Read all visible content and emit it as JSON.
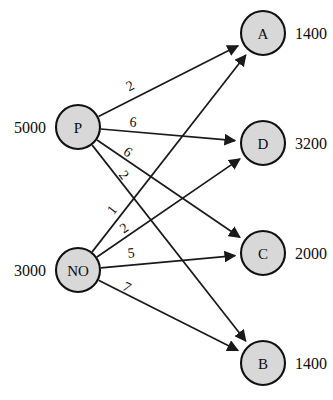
{
  "diagram": {
    "type": "bipartite-network",
    "colors": {
      "node_fill": "#d8d8d8",
      "node_stroke": "#111111",
      "edge": "#1a1a1a",
      "text": "#0d0d0d",
      "background": "#ffffff"
    },
    "sources": [
      {
        "id": "P",
        "label": "P",
        "value": "5000",
        "cx": 78,
        "cy": 127,
        "r": 22
      },
      {
        "id": "NO",
        "label": "NO",
        "value": "3000",
        "cx": 78,
        "cy": 270,
        "r": 22
      }
    ],
    "destinations": [
      {
        "id": "A",
        "label": "A",
        "value": "1400",
        "cx": 263,
        "cy": 33,
        "r": 22
      },
      {
        "id": "D",
        "label": "D",
        "value": "3200",
        "cx": 263,
        "cy": 143,
        "r": 22
      },
      {
        "id": "C",
        "label": "C",
        "value": "2000",
        "cx": 263,
        "cy": 253,
        "r": 22
      },
      {
        "id": "B",
        "label": "B",
        "value": "1400",
        "cx": 263,
        "cy": 363,
        "r": 22
      }
    ],
    "edges": [
      {
        "from": "P",
        "to": "A",
        "cost": "2",
        "lx": 130,
        "ly": 86
      },
      {
        "from": "P",
        "to": "D",
        "cost": "6",
        "lx": 133,
        "ly": 122
      },
      {
        "from": "P",
        "to": "C",
        "cost": "6",
        "lx": 128,
        "ly": 152
      },
      {
        "from": "P",
        "to": "B",
        "cost": "2",
        "lx": 124,
        "ly": 175
      },
      {
        "from": "NO",
        "to": "A",
        "cost": "1",
        "lx": 112,
        "ly": 210
      },
      {
        "from": "NO",
        "to": "D",
        "cost": "2",
        "lx": 124,
        "ly": 228
      },
      {
        "from": "NO",
        "to": "C",
        "cost": "5",
        "lx": 131,
        "ly": 253
      },
      {
        "from": "NO",
        "to": "B",
        "cost": "7",
        "lx": 127,
        "ly": 287
      }
    ]
  },
  "chart_data": {
    "type": "diagram",
    "supply_nodes": [
      {
        "name": "P",
        "supply": 5000
      },
      {
        "name": "NO",
        "supply": 3000
      }
    ],
    "demand_nodes": [
      {
        "name": "A",
        "demand": 1400
      },
      {
        "name": "D",
        "demand": 3200
      },
      {
        "name": "C",
        "demand": 2000
      },
      {
        "name": "B",
        "demand": 1400
      }
    ],
    "cost_matrix": {
      "rows": [
        "P",
        "NO"
      ],
      "columns": [
        "A",
        "D",
        "C",
        "B"
      ],
      "values": [
        [
          2,
          6,
          6,
          2
        ],
        [
          1,
          2,
          5,
          7
        ]
      ]
    }
  }
}
